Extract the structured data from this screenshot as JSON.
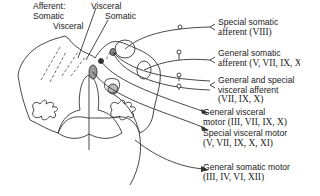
{
  "diagram": {
    "type": "brainstem cross-section with cranial nerve functional columns",
    "top_labels": {
      "afferent_header": "Afferent:",
      "somatic_left": "Somatic",
      "visceral_left": "Visceral",
      "visceral_top": "Visceral",
      "somatic_right": "Somatic"
    },
    "right_labels": [
      {
        "name": "Special somatic",
        "line2": "afferent (VIII)",
        "kind": "afferent"
      },
      {
        "name": "General somatic",
        "line2": "afferent (V, VII, IX, X)",
        "kind": "afferent"
      },
      {
        "name": "General and special",
        "line2": "visceral afferent",
        "line3": "(VII, IX, X)",
        "kind": "afferent"
      },
      {
        "name": "General visceral",
        "line2": "motor (III, VII, IX, X)",
        "kind": "efferent"
      },
      {
        "name": "Special visceral motor",
        "line2": "(V, VII, IX, X, XI)",
        "kind": "efferent"
      },
      {
        "name": "General somatic motor",
        "line2": "(III, IV, VI, XII)",
        "kind": "efferent"
      }
    ],
    "colors": {
      "line": "#333333",
      "background": "#ffffff"
    }
  }
}
